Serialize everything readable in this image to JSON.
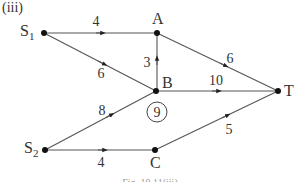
{
  "diagram": {
    "part_label": "(iii)",
    "caption": "Fig. 10.11(iii)",
    "nodes": [
      {
        "id": "S1",
        "label": "S",
        "sub": "1",
        "x": 44,
        "y": 33
      },
      {
        "id": "A",
        "label": "A",
        "sub": "",
        "x": 157,
        "y": 33
      },
      {
        "id": "B",
        "label": "B",
        "sub": "",
        "x": 156,
        "y": 91
      },
      {
        "id": "T",
        "label": "T",
        "sub": "",
        "x": 278,
        "y": 91
      },
      {
        "id": "S2",
        "label": "S",
        "sub": "2",
        "x": 45,
        "y": 150
      },
      {
        "id": "C",
        "label": "C",
        "sub": "",
        "x": 155,
        "y": 150
      }
    ],
    "edges": [
      {
        "from": "S1",
        "to": "A",
        "weight": "4"
      },
      {
        "from": "S1",
        "to": "B",
        "weight": "6"
      },
      {
        "from": "B",
        "to": "A",
        "weight": "3"
      },
      {
        "from": "A",
        "to": "T",
        "weight": "6"
      },
      {
        "from": "B",
        "to": "T",
        "weight": "10"
      },
      {
        "from": "S2",
        "to": "B",
        "weight": "8"
      },
      {
        "from": "S2",
        "to": "C",
        "weight": "4"
      },
      {
        "from": "C",
        "to": "T",
        "weight": "5"
      }
    ],
    "annotation": {
      "text": "9",
      "x": 157,
      "y": 112,
      "note": "circled value at B"
    }
  }
}
